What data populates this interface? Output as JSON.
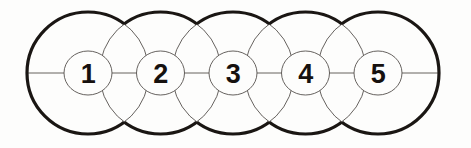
{
  "diagram": {
    "type": "overlapping-circles-chain",
    "background_color": "#fdfdfc",
    "outline_color": "#1a1613",
    "thin_line_color": "#55504d",
    "label_color": "#16110f",
    "outer_stroke_width": 3.2,
    "inner_stroke_width": 0.9,
    "geometry": {
      "circle_radius": 61,
      "center_y": 73,
      "spacing": 72.5,
      "first_center_x": 88,
      "label_ellipse_rx": 24,
      "label_ellipse_ry": 22
    },
    "nodes": [
      {
        "id": "node-1",
        "label": "1",
        "cx": 88,
        "cy": 73
      },
      {
        "id": "node-2",
        "label": "2",
        "cx": 160.5,
        "cy": 73
      },
      {
        "id": "node-3",
        "label": "3",
        "cx": 233,
        "cy": 73
      },
      {
        "id": "node-4",
        "label": "4",
        "cx": 305.5,
        "cy": 73
      },
      {
        "id": "node-5",
        "label": "5",
        "cx": 378,
        "cy": 73
      }
    ],
    "centerline": {
      "x1": 27,
      "y1": 73,
      "x2": 439,
      "y2": 73
    }
  }
}
